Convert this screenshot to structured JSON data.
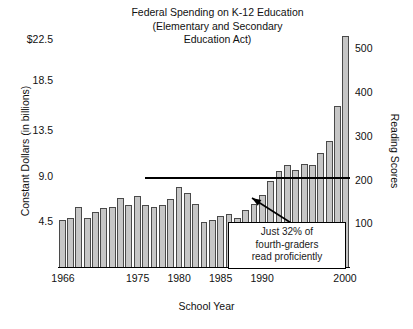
{
  "chart_data": {
    "type": "bar",
    "title": "Federal Spending on K-12 Education (Elementary and Secondary Education Act)",
    "title_lines": [
      "Federal Spending on K-12 Education",
      "(Elementary and Secondary",
      "Education Act)"
    ],
    "xlabel": "School Year",
    "ylabel": "Constant Dollars (in billions)",
    "y2label": "Reading Scores",
    "grid": false,
    "legend": "none",
    "ylim": [
      0,
      24.2
    ],
    "y2lim": [
      0,
      560
    ],
    "yticks": [
      "$22.5",
      "18.5",
      "13.5",
      "9.0",
      "4.5"
    ],
    "ytick_values": [
      22.5,
      18.5,
      13.5,
      9.0,
      4.5
    ],
    "y2ticks": [
      "500",
      "400",
      "300",
      "200",
      "100"
    ],
    "y2tick_values": [
      500,
      400,
      300,
      200,
      100
    ],
    "xticks": [
      "1966",
      "1975",
      "1980",
      "1985",
      "1990",
      "2000"
    ],
    "xtick_values": [
      1966,
      1975,
      1980,
      1985,
      1990,
      2000
    ],
    "xlim": [
      1965.4,
      2000.6
    ],
    "categories": [
      1966,
      1967,
      1968,
      1969,
      1970,
      1971,
      1972,
      1973,
      1974,
      1975,
      1976,
      1977,
      1978,
      1979,
      1980,
      1981,
      1982,
      1983,
      1984,
      1985,
      1986,
      1987,
      1988,
      1989,
      1990,
      1991,
      1992,
      1993,
      1994,
      1995,
      1996,
      1997,
      1998,
      1999,
      2000
    ],
    "series": [
      {
        "name": "Federal Spending (constant dollars, billions)",
        "values": [
          4.6,
          4.8,
          5.9,
          4.8,
          5.4,
          5.8,
          5.9,
          6.8,
          6.1,
          7.0,
          6.1,
          5.9,
          6.1,
          6.7,
          7.9,
          7.3,
          6.2,
          4.4,
          4.6,
          5.0,
          5.2,
          4.8,
          5.6,
          6.2,
          7.1,
          8.5,
          9.5,
          10.1,
          9.6,
          10.2,
          10.1,
          11.3,
          12.4,
          15.9,
          22.8
        ]
      },
      {
        "name": "Reading Scores (flat reference line)",
        "type": "line",
        "value": 205,
        "x_start": 1975.9,
        "x_end": 2000.6
      }
    ],
    "annotations": [
      {
        "name": "reading-proficiency-callout",
        "text": "Just 32% of fourth-graders read proficiently",
        "lines": [
          "Just 32% of",
          "fourth-graders",
          "read proficiently"
        ],
        "arrow_from": [
          299,
          228
        ],
        "arrow_to": [
          252,
          198
        ]
      }
    ],
    "colors": {
      "bar_fill": "#c6c6c6",
      "bar_stroke": "#4a4a4a",
      "axis": "#000000",
      "text": "#111111",
      "background": "#ffffff"
    }
  }
}
